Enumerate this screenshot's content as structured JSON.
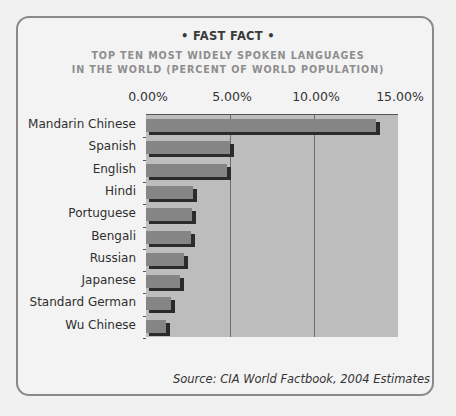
{
  "kicker": "• FAST FACT •",
  "title_line1": "TOP TEN MOST WIDELY SPOKEN LANGUAGES",
  "title_line2": "IN THE WORLD (PERCENT OF WORLD POPULATION)",
  "source": "Source: CIA World Factbook, 2004 Estimates",
  "colors": {
    "bar": "#858585",
    "bar_shadow": "#2b2b2b",
    "plot_bg": "#bdbdbd",
    "frame_border": "#8a8a8a"
  },
  "chart_data": {
    "type": "bar",
    "orientation": "horizontal",
    "title": "TOP TEN MOST WIDELY SPOKEN LANGUAGES IN THE WORLD (PERCENT OF WORLD POPULATION)",
    "subtitle": "• FAST FACT •",
    "categories": [
      "Mandarin Chinese",
      "Spanish",
      "English",
      "Hindi",
      "Portuguese",
      "Bengali",
      "Russian",
      "Japanese",
      "Standard German",
      "Wu Chinese"
    ],
    "values": [
      13.7,
      5.0,
      4.8,
      2.8,
      2.75,
      2.7,
      2.25,
      2.0,
      1.5,
      1.2
    ],
    "unit": "%",
    "xlabel": "",
    "ylabel": "",
    "xlim": [
      0,
      15
    ],
    "x_ticks": [
      "0.00%",
      "5.00%",
      "10.00%",
      "15.00%"
    ],
    "x_axis_position": "top",
    "grid": true,
    "legend": null,
    "annotation": "Source: CIA World Factbook, 2004 Estimates"
  }
}
